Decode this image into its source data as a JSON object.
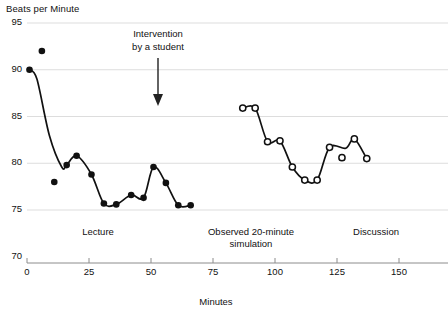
{
  "chart_data": {
    "type": "scatter",
    "title": "",
    "ylabel": "Beats per Minute",
    "xlabel": "Minutes",
    "ylim": [
      70,
      95
    ],
    "xlim": [
      0,
      160
    ],
    "yticks": [
      70,
      75,
      80,
      85,
      90,
      95
    ],
    "xticks": [
      0,
      25,
      50,
      75,
      100,
      125,
      150
    ],
    "grid": true,
    "legend": "none",
    "annotations": [
      {
        "name": "intervention-annotation",
        "text_line1": "Intervention",
        "text_line2": "by a student",
        "x": 53,
        "arrow_from_bpm": 91.2,
        "arrow_to_bpm": 86.5
      }
    ],
    "phase_labels": [
      {
        "name": "lecture",
        "text": "Lecture",
        "x_center": 29
      },
      {
        "name": "observed-simulation",
        "text_line1": "Observed 20-minute",
        "text_line2": "simulation",
        "x_center": 98
      },
      {
        "name": "discussion",
        "text": "Discussion",
        "x_center": 136
      }
    ],
    "series": [
      {
        "name": "Lecture phase (filled markers)",
        "marker": "filled-circle",
        "color": "#111111",
        "points": [
          {
            "x": 1,
            "y": 90.0
          },
          {
            "x": 6,
            "y": 92.0
          },
          {
            "x": 11,
            "y": 78.0
          },
          {
            "x": 16,
            "y": 79.8
          },
          {
            "x": 20,
            "y": 80.8
          },
          {
            "x": 26,
            "y": 78.8
          },
          {
            "x": 31,
            "y": 75.7
          },
          {
            "x": 36,
            "y": 75.6
          },
          {
            "x": 42,
            "y": 76.6
          },
          {
            "x": 47,
            "y": 76.3
          },
          {
            "x": 51,
            "y": 79.6
          },
          {
            "x": 56,
            "y": 77.9
          },
          {
            "x": 61,
            "y": 75.5
          },
          {
            "x": 66,
            "y": 75.5
          }
        ]
      },
      {
        "name": "Simulation and discussion phases (open markers)",
        "marker": "open-circle",
        "color": "#111111",
        "points": [
          {
            "x": 87,
            "y": 85.9
          },
          {
            "x": 92,
            "y": 85.9
          },
          {
            "x": 97,
            "y": 82.3
          },
          {
            "x": 102,
            "y": 82.4
          },
          {
            "x": 107,
            "y": 79.6
          },
          {
            "x": 112,
            "y": 78.2
          },
          {
            "x": 117,
            "y": 78.2
          },
          {
            "x": 122,
            "y": 81.7
          },
          {
            "x": 127,
            "y": 80.6
          },
          {
            "x": 132,
            "y": 82.6
          },
          {
            "x": 137,
            "y": 80.5
          }
        ]
      }
    ]
  }
}
